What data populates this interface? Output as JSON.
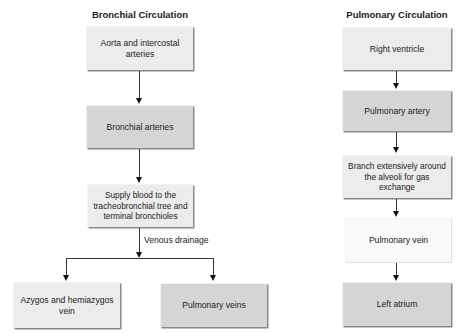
{
  "bronchial": {
    "title": "Bronchial Circulation",
    "boxes": [
      {
        "label": "Aorta and intercostal arteries",
        "shade": "light"
      },
      {
        "label": "Bronchial arteries",
        "shade": "dark"
      },
      {
        "label": "Supply blood to the tracheobronchial tree and terminal bronchioles",
        "shade": "light"
      },
      {
        "label": "Azygos and hemiazygos vein",
        "shade": "light"
      },
      {
        "label": "Pulmonary veins",
        "shade": "dark"
      }
    ],
    "branch_label": "Venous drainage"
  },
  "pulmonary": {
    "title": "Pulmonary Circulation",
    "boxes": [
      {
        "label": "Right ventricle",
        "shade": "light"
      },
      {
        "label": "Pulmonary artery",
        "shade": "dark"
      },
      {
        "label": "Branch extensively around the alveoli for gas exchange",
        "shade": "light"
      },
      {
        "label": "Pulmonary vein",
        "shade": "white"
      },
      {
        "label": "Left atrium",
        "shade": "dark"
      }
    ]
  },
  "colors": {
    "light_box": "#ececec",
    "dark_box": "#d5d5d5",
    "white_box": "#f9f9f9",
    "arrow": "#111111"
  }
}
